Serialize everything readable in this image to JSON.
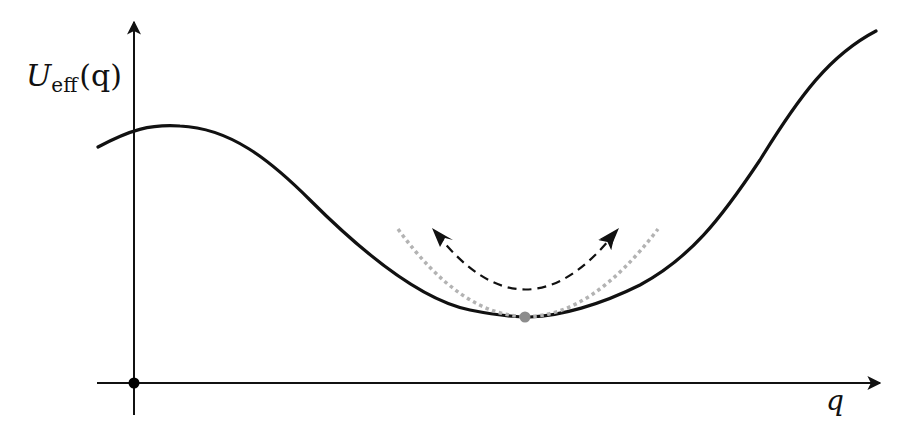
{
  "figure": {
    "type": "effective-potential-diagram",
    "y_axis_label": {
      "main": "U",
      "subscript": "eff",
      "argument": "(q)"
    },
    "x_axis_label": "q",
    "colors": {
      "curve": "#111111",
      "axes": "#111111",
      "approx_parabola": "#b3b3b3",
      "oscillation_arrow": "#111111",
      "equilibrium_point": "#8c8c8c",
      "origin_point": "#000000"
    },
    "elements": {
      "potential_curve": "Effective potential U_eff(q)",
      "harmonic_approximation": "Dotted gray parabola approximating the well near the minimum",
      "oscillation_arrow": "Dashed double-headed arc indicating oscillation about the minimum",
      "equilibrium_point": "Minimum of U_eff",
      "origin": "Origin"
    }
  }
}
